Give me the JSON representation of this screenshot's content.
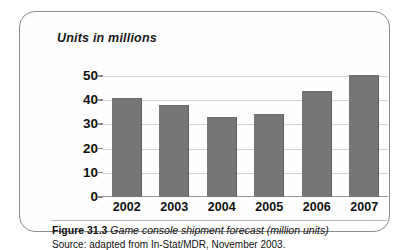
{
  "figure": {
    "number_label": "Figure 31.3",
    "caption_text": " Game console shipment forecast (million units)",
    "source": "Source: adapted from In-Stat/MDR, November 2003."
  },
  "colors": {
    "bar_fill": "#767676",
    "gridline": "#d2d2d2",
    "frame_border": "#8c8c8c",
    "text": "#111111"
  },
  "chart_data": {
    "type": "bar",
    "title": "Units in millions",
    "xlabel": "",
    "ylabel": "Units in millions",
    "categories": [
      "2002",
      "2003",
      "2004",
      "2005",
      "2006",
      "2007"
    ],
    "values": [
      41,
      38,
      33,
      34.5,
      44,
      50.5
    ],
    "ylim": [
      0,
      55
    ],
    "yticks": [
      0,
      10,
      20,
      30,
      40,
      50
    ],
    "ytick_labels": [
      "0",
      "10",
      "20",
      "30",
      "40",
      "50"
    ],
    "grid": true,
    "legend": "none"
  }
}
